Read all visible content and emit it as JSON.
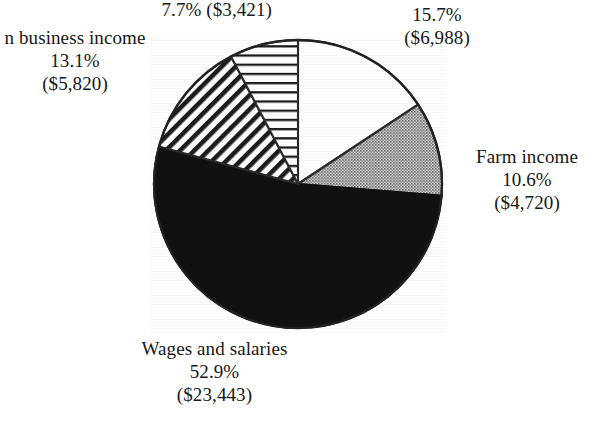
{
  "chart_data": {
    "type": "pie",
    "title": "",
    "units": "USD",
    "total_value": 44392,
    "legend": "none",
    "labels_position": "outside",
    "categories": [
      "Other off-farm income",
      "Farm income",
      "Wages and salaries",
      "Nonfarm business income",
      ""
    ],
    "values": [
      15.7,
      10.6,
      52.9,
      13.1,
      7.7
    ],
    "dollar_values": [
      6988,
      4720,
      23443,
      5820,
      3421
    ],
    "slices": [
      {
        "name": "Other off-farm income",
        "percent_text": "15.7%",
        "amount_text": "($6,988)",
        "percent": 15.7,
        "amount": 6988,
        "fill": "white",
        "fill_color": "#ffffff",
        "start_angle_deg": 0,
        "end_angle_deg": 56.52
      },
      {
        "name": "Farm income",
        "percent_text": "10.6%",
        "amount_text": "($4,720)",
        "percent": 10.6,
        "amount": 4720,
        "fill": "gray-stipple",
        "fill_color": "#a9a9a9",
        "start_angle_deg": 56.52,
        "end_angle_deg": 94.68
      },
      {
        "name": "Wages and salaries",
        "percent_text": "52.9%",
        "amount_text": "($23,443)",
        "percent": 52.9,
        "amount": 23443,
        "fill": "solid-black",
        "fill_color": "#111111",
        "start_angle_deg": 94.68,
        "end_angle_deg": 285.12
      },
      {
        "name": "Nonfarm business income",
        "percent_text": "13.1%",
        "amount_text": "($5,820)",
        "percent": 13.1,
        "amount": 5820,
        "fill": "diagonal-hatch",
        "fill_color": "#ffffff",
        "start_angle_deg": 285.12,
        "end_angle_deg": 332.28
      },
      {
        "name": "",
        "percent_text": "7.7%",
        "amount_text": "($3,421)",
        "percent": 7.7,
        "amount": 3421,
        "fill": "horizontal-hatch",
        "fill_color": "#ffffff",
        "start_angle_deg": 332.28,
        "end_angle_deg": 360
      }
    ]
  },
  "labels": {
    "horizontal_hatch": {
      "line1": "7.7% ($3,421)"
    },
    "nonfarm_business": {
      "line1": "n business income",
      "line2": "13.1%",
      "line3": "($5,820)"
    },
    "other_offfarm": {
      "line1": "Other off-farm income",
      "line2": "15.7%",
      "line3": "($6,988)"
    },
    "farm_income": {
      "line1": "Farm income",
      "line2": "10.6%",
      "line3": "($4,720)"
    },
    "wages": {
      "line1": "Wages and salaries",
      "line2": "52.9%",
      "line3": "($23,443)"
    }
  },
  "colors": {
    "background": "#ffffff",
    "ink": "#171717",
    "solid_black": "#111111",
    "gray_stipple": "#a9a9a9",
    "outline": "#2a2a2a"
  }
}
